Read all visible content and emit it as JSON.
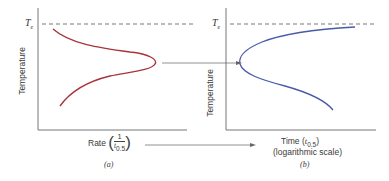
{
  "panel_a": {
    "equilibrium_label": "T",
    "equilibrium_sub": "e",
    "y_label": "Temperature",
    "x_label_prefix": "Rate",
    "x_label_frac_num": "1",
    "x_label_frac_den": "t",
    "x_label_frac_den_sub": "0.5",
    "caption": "(a)",
    "curve_color": "#a8333a"
  },
  "panel_b": {
    "equilibrium_label": "T",
    "equilibrium_sub": "e",
    "y_label": "Temperature",
    "x_label_line1_prefix": "Time (",
    "x_label_t": "t",
    "x_label_sub": "0.5",
    "x_label_line1_suffix": ")",
    "x_label_line2": "(logarithmic scale)",
    "caption": "(b)",
    "curve_color": "#4a5aa8"
  },
  "colors": {
    "axis": "#555555",
    "dashed": "#555555",
    "arrow": "#666666"
  }
}
